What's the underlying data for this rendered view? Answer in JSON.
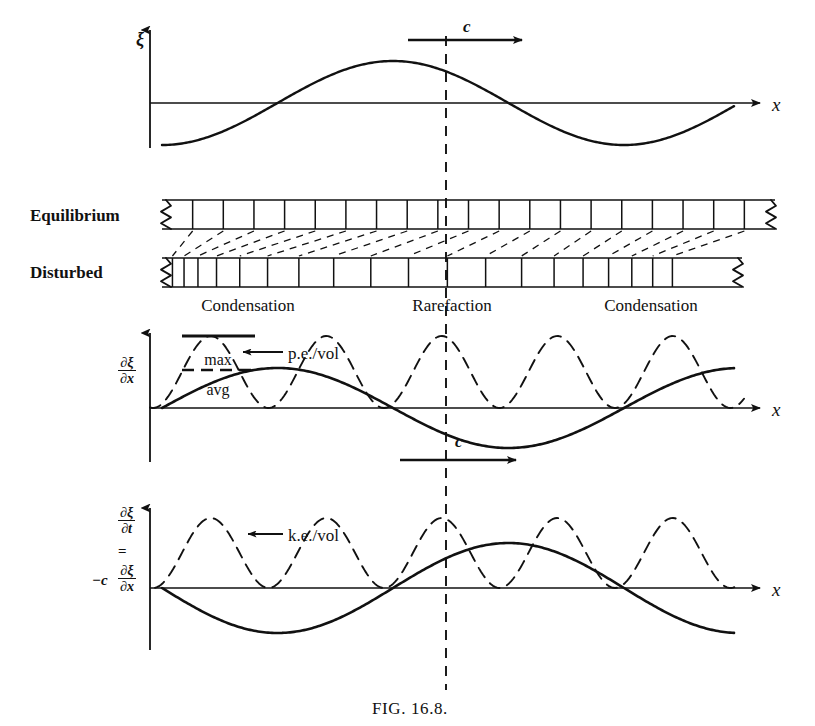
{
  "figure": {
    "caption": "FIG. 16.8.",
    "caption_x": 410,
    "caption_y": 700,
    "width": 815,
    "height": 726,
    "ink_color": "#111111",
    "background": "#ffffff",
    "wave_left": 162,
    "wave_right": 775,
    "marker_line_x": 446,
    "marker_line_top": 36,
    "marker_line_bottom": 690
  },
  "panels": {
    "displacement": {
      "name": "displacement-panel",
      "axis_y": 103,
      "axis_x0": 150,
      "axis_x1": 760,
      "y_axis_top": 30,
      "y_axis_bottom": 148,
      "y_label": "ξ",
      "y_label_x": 136,
      "y_label_y": 30,
      "x_label": "x",
      "x_label_x": 772,
      "x_label_y": 95,
      "amplitude": 42,
      "wavelength": 462,
      "phase_deg": 180,
      "curve_x0": 162,
      "curve_x1": 735,
      "speed_arrow": {
        "label": "c",
        "label_x": 463,
        "label_y": 18,
        "x0": 408,
        "x1": 522,
        "y": 40
      }
    },
    "medium": {
      "name": "medium-panel",
      "equilibrium_label": "Equilibrium",
      "equilibrium_label_x": 30,
      "equilibrium_label_y": 207,
      "disturbed_label": "Disturbed",
      "disturbed_label_x": 30,
      "disturbed_label_y": 264,
      "bar_left": 162,
      "bar_right": 775,
      "eq_top": 200,
      "eq_bottom": 229,
      "dist_top": 258,
      "dist_bottom": 287,
      "dist_right": 742,
      "n_cells": 20,
      "equilibrium_positions": [
        0,
        0.05,
        0.1,
        0.15,
        0.2,
        0.25,
        0.3,
        0.35,
        0.4,
        0.45,
        0.5,
        0.55,
        0.6,
        0.65,
        0.7,
        0.75,
        0.8,
        0.85,
        0.9,
        0.95,
        1
      ],
      "disturbed_positions": [
        0,
        0.018,
        0.038,
        0.062,
        0.094,
        0.134,
        0.182,
        0.236,
        0.296,
        0.36,
        0.425,
        0.492,
        0.558,
        0.62,
        0.676,
        0.726,
        0.77,
        0.81,
        0.846,
        0.88,
        0.915
      ],
      "zones": [
        {
          "label": "Condensation",
          "x": 248,
          "y": 297
        },
        {
          "label": "Rarefaction",
          "x": 452,
          "y": 297
        },
        {
          "label": "Condensation",
          "x": 651,
          "y": 297
        }
      ]
    },
    "strain": {
      "name": "strain-panel",
      "axis_y": 408,
      "axis_x0": 150,
      "axis_x1": 760,
      "y_axis_top": 333,
      "y_axis_bottom": 462,
      "y_label_num": "∂ξ",
      "y_label_den": "∂x",
      "y_label_x": 118,
      "y_label_y": 355,
      "x_label": "x",
      "x_label_x": 772,
      "x_label_y": 400,
      "solid_amplitude": 40,
      "solid_phase_deg": 270,
      "dashed_amplitude": 72,
      "dashed_baseline_offset": 0,
      "curve_x0": 162,
      "curve_x1": 735,
      "dash_x0": 150,
      "dash_x1": 745,
      "callout": {
        "label": "p.e./vol",
        "label_x": 288,
        "label_y": 345,
        "arrow_x0": 283,
        "arrow_x1": 243,
        "arrow_y": 352
      },
      "legend": {
        "max_label": "max",
        "max_x": 218,
        "max_y": 352,
        "max_rule_x0": 182,
        "max_rule_x1": 255,
        "max_rule_y": 336,
        "avg_label": "avg",
        "avg_x": 218,
        "avg_y": 382,
        "avg_rule_x0": 182,
        "avg_rule_x1": 255,
        "avg_rule_y": 370
      },
      "speed_arrow": {
        "label": "c",
        "label_x": 455,
        "label_y": 433,
        "x0": 400,
        "x1": 516,
        "y": 460
      }
    },
    "velocity": {
      "name": "velocity-panel",
      "axis_y": 588,
      "axis_x0": 150,
      "axis_x1": 760,
      "y_axis_top": 508,
      "y_axis_bottom": 650,
      "y_label_num": "∂ξ",
      "y_label_den": "∂t",
      "y_label_x": 118,
      "y_label_y": 505,
      "eq_sign": "=",
      "eq_x": 118,
      "eq_y": 543,
      "minus_c": "−c",
      "minus_c_x": 92,
      "minus_c_y": 572,
      "y_label2_num": "∂ξ",
      "y_label2_den": "∂x",
      "y_label2_x": 118,
      "y_label2_y": 563,
      "x_label": "x",
      "x_label_x": 772,
      "x_label_y": 580,
      "solid_amplitude": 45,
      "solid_phase_deg": 90,
      "dashed_amplitude": 70,
      "curve_x0": 162,
      "curve_x1": 735,
      "dash_x0": 155,
      "dash_x1": 740,
      "callout": {
        "label": "k.e./vol",
        "label_x": 288,
        "label_y": 527,
        "arrow_x0": 283,
        "arrow_x1": 248,
        "arrow_y": 534
      }
    }
  },
  "chart_data": {
    "type": "line",
    "title": "FIG. 16.8.",
    "xlabel": "x",
    "wavelength_px": 462,
    "origin_x_px": 162,
    "marker_x_px": 446,
    "grid": false,
    "legend": [
      "max",
      "avg",
      "p.e./vol",
      "k.e./vol"
    ],
    "series": [
      {
        "name": "displacement",
        "panel": "displacement",
        "ylabel": "ξ",
        "style": "solid",
        "formula": "xi = A*cos(2*pi*(x-x0)/lambda)",
        "amplitude": 42,
        "phase_deg": 180,
        "zero_crossings_px": [
          228,
          446,
          690
        ],
        "extrema_px": [
          {
            "x": 162,
            "type": "start-max"
          },
          {
            "x": 330,
            "type": "min"
          },
          {
            "x": 565,
            "type": "max"
          }
        ]
      },
      {
        "name": "strain",
        "panel": "strain",
        "ylabel": "∂ξ/∂x",
        "style": "solid",
        "amplitude": 40,
        "phase_deg": 270,
        "zero_crossings_px": [
          330,
          565
        ],
        "extrema_px": [
          {
            "x": 215,
            "type": "min"
          },
          {
            "x": 446,
            "type": "max"
          },
          {
            "x": 680,
            "type": "min"
          }
        ]
      },
      {
        "name": "p.e./vol",
        "panel": "strain",
        "style": "dashed",
        "amplitude": 72,
        "formula": "proportional to (d_xi/dx)^2",
        "peaks_px": [
          215,
          446,
          680
        ],
        "zeros_px": [
          330,
          565
        ]
      },
      {
        "name": "velocity",
        "panel": "velocity",
        "ylabel": "∂ξ/∂t = −c ∂ξ/∂x",
        "style": "solid",
        "amplitude": 45,
        "phase_deg": 90,
        "zero_crossings_px": [
          330,
          565
        ],
        "extrema_px": [
          {
            "x": 215,
            "type": "max"
          },
          {
            "x": 446,
            "type": "min"
          },
          {
            "x": 680,
            "type": "max"
          }
        ]
      },
      {
        "name": "k.e./vol",
        "panel": "velocity",
        "style": "dashed",
        "amplitude": 70,
        "formula": "proportional to (d_xi/dt)^2",
        "peaks_px": [
          215,
          446,
          680
        ],
        "zeros_px": [
          330,
          565
        ]
      }
    ]
  }
}
